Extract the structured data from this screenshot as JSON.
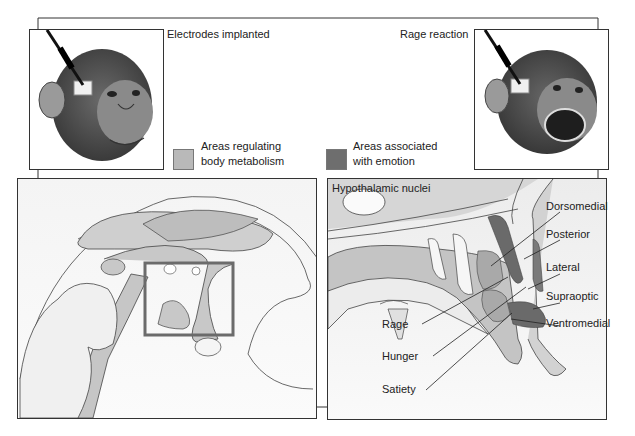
{
  "figure": {
    "top_left_panel": {
      "caption": "Electrodes implanted"
    },
    "top_right_panel": {
      "caption": "Rage reaction"
    },
    "legend": [
      {
        "label_line1": "Areas regulating",
        "label_line2": "body metabolism",
        "color": "#b9b9b9"
      },
      {
        "label_line1": "Areas associated",
        "label_line2": "with emotion",
        "color": "#6e6e6e"
      }
    ],
    "bottom_right_panel": {
      "title": "Hypothalamic nuclei",
      "labels_right": [
        "Dorsomedial",
        "Posterior",
        "Lateral",
        "Supraoptic",
        "Ventromedial"
      ],
      "labels_left": [
        "Rage",
        "Hunger",
        "Satiety"
      ]
    },
    "colors": {
      "line": "#333333",
      "light_fill": "#d9d9d9",
      "mid_fill": "#b5b5b5",
      "dark_fill": "#6a6a6a",
      "panel_bg": "#f4f4f4",
      "highlight_box": "#6b6b6b"
    }
  }
}
